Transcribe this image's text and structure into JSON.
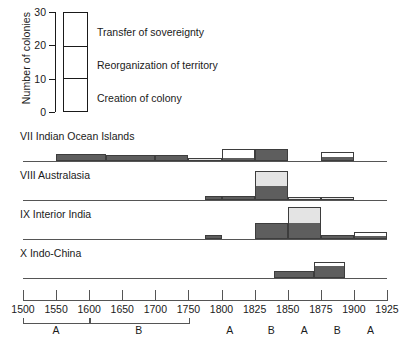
{
  "chart_data": {
    "type": "bar",
    "title": "",
    "xlabel": "",
    "ylabel": "Number of colonies",
    "ylim": [
      0,
      30
    ],
    "yticks": [
      0,
      10,
      20,
      30
    ],
    "grid": false,
    "legend_position": "top-left",
    "legend": [
      {
        "label": "Transfer of sovereignty",
        "color": "#ffffff",
        "range": [
          20,
          30
        ]
      },
      {
        "label": "Reorganization of territory",
        "color": "#e4e4e4",
        "range": [
          10,
          20
        ]
      },
      {
        "label": "Creation of colony",
        "color": "#5e5e5e",
        "range": [
          0,
          10
        ]
      }
    ],
    "x_axis": {
      "ticks": [
        1500,
        1550,
        1600,
        1650,
        1700,
        1750,
        1800,
        1825,
        1850,
        1875,
        1900,
        1925
      ],
      "note": "piecewise scale: 50-year steps to 1750, 25-year steps after"
    },
    "periods": [
      {
        "label": "A",
        "start": 1500,
        "end": 1600,
        "bracket": true
      },
      {
        "label": "B",
        "start": 1600,
        "end": 1750,
        "bracket": true
      },
      {
        "label": "A",
        "start": 1775,
        "end": 1825,
        "bracket": false
      },
      {
        "label": "B",
        "start": 1825,
        "end": 1850,
        "bracket": false
      },
      {
        "label": "A",
        "start": 1850,
        "end": 1875,
        "bracket": false
      },
      {
        "label": "B",
        "start": 1875,
        "end": 1900,
        "bracket": false
      },
      {
        "label": "A",
        "start": 1900,
        "end": 1925,
        "bracket": false
      }
    ],
    "series": [
      {
        "name": "VII  Indian Ocean Islands",
        "numeral": "VII",
        "region": "Indian Ocean Islands",
        "bins": [
          {
            "start": 1550,
            "end": 1625,
            "creation": 5,
            "reorganization": 0,
            "transfer": 0
          },
          {
            "start": 1625,
            "end": 1700,
            "creation": 4,
            "reorganization": 0,
            "transfer": 0
          },
          {
            "start": 1700,
            "end": 1750,
            "creation": 4,
            "reorganization": 0,
            "transfer": 0
          },
          {
            "start": 1750,
            "end": 1800,
            "creation": 0,
            "reorganization": 2,
            "transfer": 0
          },
          {
            "start": 1800,
            "end": 1825,
            "creation": 2,
            "reorganization": 0,
            "transfer": 6
          },
          {
            "start": 1825,
            "end": 1850,
            "creation": 8,
            "reorganization": 0,
            "transfer": 0
          },
          {
            "start": 1875,
            "end": 1900,
            "creation": 3,
            "reorganization": 0,
            "transfer": 3
          }
        ]
      },
      {
        "name": "VIII Australasia",
        "numeral": "VIII",
        "region": "Australasia",
        "bins": [
          {
            "start": 1775,
            "end": 1800,
            "creation": 3,
            "reorganization": 0,
            "transfer": 0
          },
          {
            "start": 1800,
            "end": 1825,
            "creation": 3,
            "reorganization": 0,
            "transfer": 0
          },
          {
            "start": 1825,
            "end": 1850,
            "creation": 10,
            "reorganization": 10,
            "transfer": 0
          },
          {
            "start": 1850,
            "end": 1875,
            "creation": 0,
            "reorganization": 2,
            "transfer": 0
          },
          {
            "start": 1875,
            "end": 1900,
            "creation": 0,
            "reorganization": 2,
            "transfer": 0
          }
        ]
      },
      {
        "name": "IX  Interior India",
        "numeral": "IX",
        "region": "Interior India",
        "bins": [
          {
            "start": 1775,
            "end": 1800,
            "creation": 3,
            "reorganization": 0,
            "transfer": 0
          },
          {
            "start": 1825,
            "end": 1850,
            "creation": 11,
            "reorganization": 0,
            "transfer": 0
          },
          {
            "start": 1850,
            "end": 1875,
            "creation": 11,
            "reorganization": 11,
            "transfer": 0
          },
          {
            "start": 1875,
            "end": 1900,
            "creation": 3,
            "reorganization": 0,
            "transfer": 0
          },
          {
            "start": 1900,
            "end": 1925,
            "creation": 2,
            "reorganization": 0,
            "transfer": 3
          }
        ]
      },
      {
        "name": "X  Indo-China",
        "numeral": "X",
        "region": "Indo-China",
        "bins": [
          {
            "start": 1840,
            "end": 1870,
            "creation": 5,
            "reorganization": 0,
            "transfer": 0
          },
          {
            "start": 1870,
            "end": 1893,
            "creation": 9,
            "reorganization": 0,
            "transfer": 2
          }
        ]
      }
    ]
  }
}
